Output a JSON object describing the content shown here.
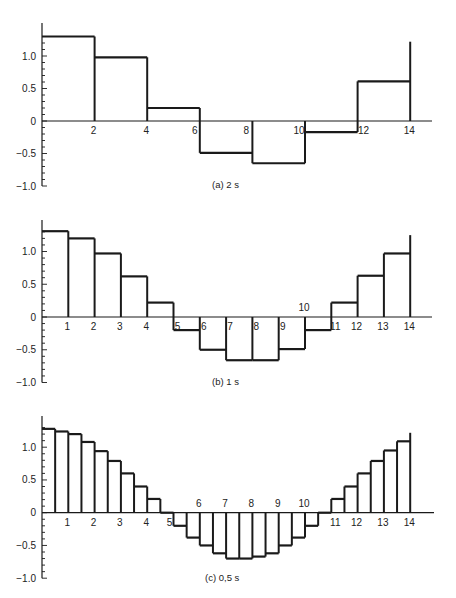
{
  "chart_data": [
    {
      "type": "step",
      "title": "",
      "caption": "(a)  2 s",
      "xlabel": "",
      "ylabel": "",
      "xlim": [
        0,
        14.8
      ],
      "ylim": [
        -1.0,
        1.4
      ],
      "grid": false,
      "step_width": 2,
      "x_ticks": [
        2,
        4,
        6,
        8,
        10,
        12,
        14
      ],
      "y_ticks": [
        "1.0",
        "0.5",
        "0",
        "-0.5",
        "-1.0"
      ],
      "x": [
        0,
        2,
        4,
        6,
        8,
        10,
        12
      ],
      "values": [
        1.3,
        0.98,
        0.2,
        -0.49,
        -0.65,
        -0.17,
        0.61
      ],
      "end_spike": 1.22
    },
    {
      "type": "step",
      "title": "",
      "caption": "(b)  1 s",
      "xlabel": "",
      "ylabel": "",
      "xlim": [
        0,
        14.8
      ],
      "ylim": [
        -1.0,
        1.4
      ],
      "grid": false,
      "step_width": 1,
      "x_ticks": [
        1,
        2,
        3,
        4,
        5,
        6,
        7,
        8,
        9,
        10,
        11,
        12,
        13,
        14
      ],
      "y_ticks": [
        "1.0",
        "0.5",
        "0",
        "-0.5",
        "-1.0"
      ],
      "x": [
        0,
        1,
        2,
        3,
        4,
        5,
        6,
        7,
        8,
        9,
        10,
        11,
        12,
        13
      ],
      "values": [
        1.31,
        1.2,
        0.97,
        0.62,
        0.22,
        -0.2,
        -0.5,
        -0.66,
        -0.66,
        -0.49,
        -0.2,
        0.22,
        0.63,
        0.97
      ],
      "end_spike": 1.25
    },
    {
      "type": "step",
      "title": "",
      "caption": "(c)  0,5 s",
      "xlabel": "",
      "ylabel": "",
      "xlim": [
        0,
        14.8
      ],
      "ylim": [
        -1.0,
        1.4
      ],
      "grid": false,
      "step_width": 0.5,
      "x_ticks": [
        1,
        2,
        3,
        4,
        5,
        6,
        7,
        8,
        9,
        10,
        11,
        12,
        13,
        14
      ],
      "y_ticks": [
        "1.0",
        "0.5",
        "0",
        "-0.5",
        "-1.0"
      ],
      "x": [
        0,
        0.5,
        1,
        1.5,
        2,
        2.5,
        3,
        3.5,
        4,
        4.5,
        5,
        5.5,
        6,
        6.5,
        7,
        7.5,
        8,
        8.5,
        9,
        9.5,
        10,
        10.5,
        11,
        11.5,
        12,
        12.5,
        13,
        13.5
      ],
      "values": [
        1.28,
        1.24,
        1.2,
        1.08,
        0.94,
        0.79,
        0.6,
        0.4,
        0.21,
        0.0,
        -0.2,
        -0.38,
        -0.5,
        -0.62,
        -0.7,
        -0.7,
        -0.67,
        -0.62,
        -0.5,
        -0.38,
        -0.2,
        0.0,
        0.21,
        0.4,
        0.6,
        0.79,
        0.95,
        1.09
      ],
      "end_spike": 1.22
    }
  ],
  "layout": {
    "panels": [
      {
        "x0": 42,
        "y0": 121,
        "x_per_unit": 26.3,
        "y_per_unit": 65,
        "axis_top": 23,
        "axis_right": 432,
        "caption_x": 212,
        "caption_y": 188
      },
      {
        "x0": 42,
        "y0": 317,
        "x_per_unit": 26.3,
        "y_per_unit": 65.5,
        "axis_top": 220,
        "axis_right": 432,
        "caption_x": 212,
        "caption_y": 385
      },
      {
        "x0": 42,
        "y0": 512.7,
        "x_per_unit": 26.3,
        "y_per_unit": 65.5,
        "axis_top": 416,
        "axis_right": 434,
        "caption_x": 205,
        "caption_y": 581
      }
    ],
    "line_color": "#1a1a1a",
    "text_color": "#222222"
  }
}
